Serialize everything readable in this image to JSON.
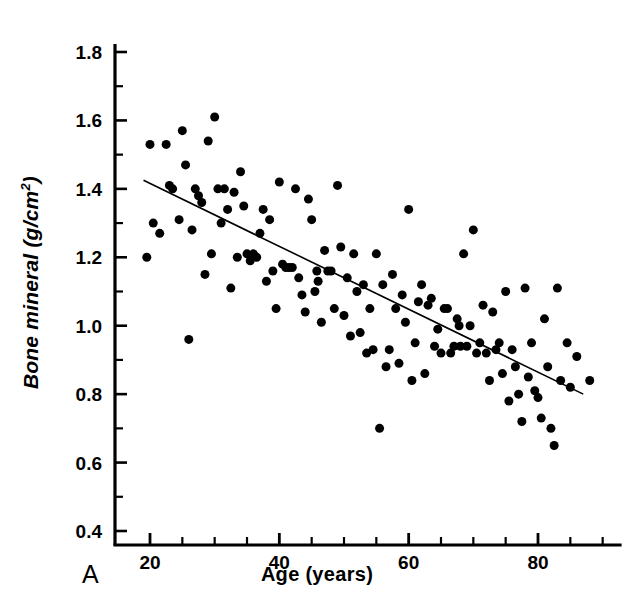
{
  "figure": {
    "panel_label": "A",
    "xlabel": "Age (years)",
    "ylabel_text": "Bone mineral (g/cm",
    "ylabel_sup": "2",
    "ylabel_tail": ")",
    "colors": {
      "ink": "#000000",
      "background": "#ffffff"
    }
  },
  "chart_data": {
    "type": "scatter",
    "title": "",
    "xlabel": "Age (years)",
    "ylabel": "Bone mineral (g/cm2)",
    "xlim": [
      14,
      92
    ],
    "ylim": [
      0.4,
      1.8
    ],
    "xticks": [
      20,
      40,
      60,
      80
    ],
    "xtick_labels": [
      "20",
      "40",
      "60",
      "80"
    ],
    "xminor_step": 5,
    "yticks": [
      0.4,
      0.6,
      0.8,
      1.0,
      1.2,
      1.4,
      1.6,
      1.8
    ],
    "ytick_labels": [
      "0.4",
      "0.6",
      "0.8",
      "1.0",
      "1.2",
      "1.4",
      "1.6",
      "1.8"
    ],
    "yminor_step": 0.1,
    "grid": false,
    "legend": null,
    "marker": {
      "shape": "circle",
      "color": "#000000",
      "size_px": 9
    },
    "trendline": {
      "type": "linear-regression",
      "color": "#000000",
      "width_px": 1.6,
      "x_start": 19.0,
      "y_start": 1.425,
      "x_end": 87.0,
      "y_end": 0.8
    },
    "n_points": 130,
    "points": [
      [
        19.5,
        1.2
      ],
      [
        20.0,
        1.53
      ],
      [
        20.5,
        1.3
      ],
      [
        21.5,
        1.27
      ],
      [
        22.5,
        1.53
      ],
      [
        23.0,
        1.41
      ],
      [
        23.5,
        1.4
      ],
      [
        24.5,
        1.31
      ],
      [
        25.0,
        1.57
      ],
      [
        25.5,
        1.47
      ],
      [
        26.0,
        0.96
      ],
      [
        26.5,
        1.28
      ],
      [
        27.0,
        1.4
      ],
      [
        27.5,
        1.38
      ],
      [
        28.0,
        1.36
      ],
      [
        28.5,
        1.15
      ],
      [
        29.0,
        1.54
      ],
      [
        29.5,
        1.21
      ],
      [
        30.0,
        1.61
      ],
      [
        30.5,
        1.4
      ],
      [
        31.0,
        1.3
      ],
      [
        31.5,
        1.4
      ],
      [
        32.0,
        1.34
      ],
      [
        32.5,
        1.11
      ],
      [
        33.0,
        1.39
      ],
      [
        33.5,
        1.2
      ],
      [
        34.0,
        1.45
      ],
      [
        34.5,
        1.35
      ],
      [
        35.0,
        1.21
      ],
      [
        35.5,
        1.19
      ],
      [
        36.0,
        1.21
      ],
      [
        36.5,
        1.2
      ],
      [
        37.0,
        1.27
      ],
      [
        37.5,
        1.34
      ],
      [
        38.0,
        1.13
      ],
      [
        38.5,
        1.31
      ],
      [
        39.0,
        1.16
      ],
      [
        39.5,
        1.05
      ],
      [
        40.0,
        1.42
      ],
      [
        40.5,
        1.18
      ],
      [
        41.0,
        1.17
      ],
      [
        41.5,
        1.17
      ],
      [
        42.0,
        1.17
      ],
      [
        42.5,
        1.4
      ],
      [
        43.0,
        1.14
      ],
      [
        43.5,
        1.09
      ],
      [
        44.0,
        1.04
      ],
      [
        44.5,
        1.37
      ],
      [
        45.0,
        1.31
      ],
      [
        45.5,
        1.1
      ],
      [
        46.0,
        1.13
      ],
      [
        46.5,
        1.01
      ],
      [
        47.0,
        1.22
      ],
      [
        47.5,
        1.16
      ],
      [
        48.0,
        1.16
      ],
      [
        48.5,
        1.05
      ],
      [
        49.0,
        1.41
      ],
      [
        49.5,
        1.23
      ],
      [
        50.0,
        1.03
      ],
      [
        50.5,
        1.14
      ],
      [
        51.0,
        0.97
      ],
      [
        51.5,
        1.21
      ],
      [
        52.0,
        1.1
      ],
      [
        52.5,
        0.98
      ],
      [
        53.0,
        1.12
      ],
      [
        53.5,
        0.92
      ],
      [
        54.0,
        1.05
      ],
      [
        54.5,
        0.93
      ],
      [
        55.0,
        1.21
      ],
      [
        55.5,
        0.7
      ],
      [
        56.0,
        1.12
      ],
      [
        56.5,
        0.88
      ],
      [
        57.0,
        0.93
      ],
      [
        57.5,
        1.15
      ],
      [
        58.0,
        1.05
      ],
      [
        58.5,
        0.89
      ],
      [
        59.0,
        1.09
      ],
      [
        59.5,
        1.01
      ],
      [
        60.0,
        1.34
      ],
      [
        60.5,
        0.84
      ],
      [
        61.0,
        0.95
      ],
      [
        61.5,
        1.07
      ],
      [
        62.0,
        1.12
      ],
      [
        62.5,
        0.86
      ],
      [
        63.0,
        1.06
      ],
      [
        63.5,
        1.08
      ],
      [
        64.0,
        0.94
      ],
      [
        64.5,
        0.99
      ],
      [
        65.0,
        0.92
      ],
      [
        65.5,
        1.05
      ],
      [
        66.0,
        1.05
      ],
      [
        66.5,
        0.92
      ],
      [
        67.0,
        0.94
      ],
      [
        67.5,
        1.02
      ],
      [
        68.0,
        0.94
      ],
      [
        68.5,
        1.21
      ],
      [
        69.0,
        0.94
      ],
      [
        69.5,
        1.0
      ],
      [
        70.0,
        1.28
      ],
      [
        70.5,
        0.92
      ],
      [
        71.0,
        0.95
      ],
      [
        71.5,
        1.06
      ],
      [
        72.0,
        0.92
      ],
      [
        72.5,
        0.84
      ],
      [
        73.0,
        1.04
      ],
      [
        73.5,
        0.93
      ],
      [
        74.0,
        0.95
      ],
      [
        74.5,
        0.86
      ],
      [
        75.0,
        1.1
      ],
      [
        75.5,
        0.78
      ],
      [
        76.0,
        0.93
      ],
      [
        76.5,
        0.88
      ],
      [
        77.0,
        0.8
      ],
      [
        77.5,
        0.72
      ],
      [
        78.0,
        1.11
      ],
      [
        78.5,
        0.85
      ],
      [
        79.0,
        0.95
      ],
      [
        79.5,
        0.81
      ],
      [
        80.0,
        0.79
      ],
      [
        80.5,
        0.73
      ],
      [
        81.0,
        1.02
      ],
      [
        81.5,
        0.88
      ],
      [
        82.0,
        0.7
      ],
      [
        82.5,
        0.65
      ],
      [
        83.0,
        1.11
      ],
      [
        83.5,
        0.84
      ],
      [
        84.5,
        0.95
      ],
      [
        85.0,
        0.82
      ],
      [
        86.0,
        0.91
      ],
      [
        88.0,
        0.84
      ],
      [
        45.8,
        1.16
      ],
      [
        67.8,
        1.0
      ]
    ]
  }
}
